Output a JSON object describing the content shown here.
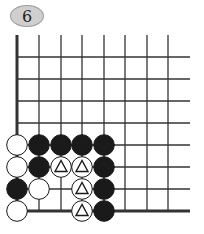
{
  "problem": {
    "number": "6"
  },
  "board": {
    "columns": 8,
    "rows": 8,
    "origin_corner": "bottom-left",
    "stones": [
      {
        "col": 0,
        "row": 3,
        "color": "white",
        "mark": ""
      },
      {
        "col": 1,
        "row": 3,
        "color": "black",
        "mark": ""
      },
      {
        "col": 2,
        "row": 3,
        "color": "black",
        "mark": ""
      },
      {
        "col": 3,
        "row": 3,
        "color": "black",
        "mark": ""
      },
      {
        "col": 4,
        "row": 3,
        "color": "black",
        "mark": ""
      },
      {
        "col": 0,
        "row": 2,
        "color": "white",
        "mark": ""
      },
      {
        "col": 1,
        "row": 2,
        "color": "black",
        "mark": ""
      },
      {
        "col": 2,
        "row": 2,
        "color": "white",
        "mark": "triangle"
      },
      {
        "col": 3,
        "row": 2,
        "color": "white",
        "mark": "triangle"
      },
      {
        "col": 4,
        "row": 2,
        "color": "black",
        "mark": ""
      },
      {
        "col": 0,
        "row": 1,
        "color": "black",
        "mark": ""
      },
      {
        "col": 1,
        "row": 1,
        "color": "white",
        "mark": ""
      },
      {
        "col": 3,
        "row": 1,
        "color": "white",
        "mark": "triangle"
      },
      {
        "col": 4,
        "row": 1,
        "color": "black",
        "mark": ""
      },
      {
        "col": 0,
        "row": 0,
        "color": "white",
        "mark": ""
      },
      {
        "col": 3,
        "row": 0,
        "color": "white",
        "mark": "triangle"
      },
      {
        "col": 4,
        "row": 0,
        "color": "black",
        "mark": ""
      }
    ]
  },
  "colors": {
    "line": "#333333",
    "black_stone": "#1a1a1a",
    "white_stone": "#ffffff",
    "badge": "#cfcfcf"
  }
}
